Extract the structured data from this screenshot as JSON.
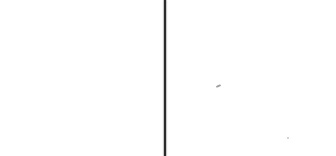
{
  "page": {
    "background": "#ffffff"
  },
  "vertical_rule": {
    "left": "163.5px",
    "top": "0px",
    "width": "2.5px",
    "height": "156px",
    "color": "#2a2a2a",
    "edge_shadow": "1px 0 1px rgba(90,90,90,0.35), -1px 0 1px rgba(90,90,90,0.35)"
  },
  "specks": {
    "speck1": {
      "left": "216px",
      "top": "85px",
      "width": "5px",
      "height": "2px",
      "color": "#9e9e9e",
      "transform": "rotate(-22deg)"
    },
    "speck2": {
      "left": "287px",
      "top": "137px",
      "width": "2px",
      "height": "2px",
      "color": "#c6c6c6",
      "transform": "none"
    }
  }
}
